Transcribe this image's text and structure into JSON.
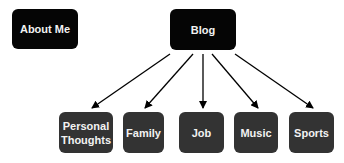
{
  "diagram": {
    "top_nodes": [
      {
        "label": "About Me",
        "x": 12,
        "y": 9,
        "w": 66,
        "h": 40
      },
      {
        "label": "Blog",
        "x": 170,
        "y": 9,
        "w": 66,
        "h": 41
      }
    ],
    "children": [
      {
        "label": "Personal Thoughts",
        "x": 59,
        "y": 112,
        "w": 54,
        "h": 41
      },
      {
        "label": "Family",
        "x": 123,
        "y": 112,
        "w": 41,
        "h": 41
      },
      {
        "label": "Job",
        "x": 179,
        "y": 112,
        "w": 45,
        "h": 41
      },
      {
        "label": "Music",
        "x": 234,
        "y": 112,
        "w": 44,
        "h": 41
      },
      {
        "label": "Sports",
        "x": 289,
        "y": 112,
        "w": 45,
        "h": 41
      }
    ],
    "edges": [
      {
        "from": "Blog",
        "to": "Personal Thoughts"
      },
      {
        "from": "Blog",
        "to": "Family"
      },
      {
        "from": "Blog",
        "to": "Job"
      },
      {
        "from": "Blog",
        "to": "Music"
      },
      {
        "from": "Blog",
        "to": "Sports"
      }
    ]
  }
}
